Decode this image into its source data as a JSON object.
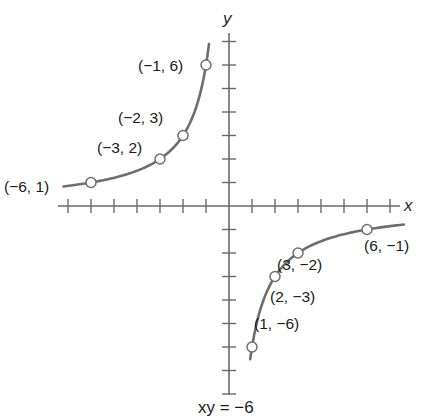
{
  "chart_data": {
    "type": "line",
    "title": "",
    "caption": "xy = −6",
    "xlabel": "x",
    "ylabel": "y",
    "equation": "xy = -6",
    "xlim": [
      -7,
      7
    ],
    "ylim": [
      -8,
      7
    ],
    "x_ticks": [
      -7,
      -6,
      -5,
      -4,
      -3,
      -2,
      -1,
      1,
      2,
      3,
      4,
      5,
      6,
      7
    ],
    "y_ticks": [
      -8,
      -7,
      -6,
      -5,
      -4,
      -3,
      -2,
      -1,
      1,
      2,
      3,
      4,
      5,
      6,
      7
    ],
    "grid": false,
    "series": [
      {
        "name": "xy = -6 (branch x<0)",
        "points": [
          {
            "x": -6,
            "y": 1,
            "label": "(−6, 1)"
          },
          {
            "x": -3,
            "y": 2,
            "label": "(−3, 2)"
          },
          {
            "x": -2,
            "y": 3,
            "label": "(−2, 3)"
          },
          {
            "x": -1,
            "y": 6,
            "label": "(−1, 6)"
          }
        ]
      },
      {
        "name": "xy = -6 (branch x>0)",
        "points": [
          {
            "x": 1,
            "y": -6,
            "label": "(1, −6)"
          },
          {
            "x": 2,
            "y": -3,
            "label": "(2, −3)"
          },
          {
            "x": 3,
            "y": -2,
            "label": "(3, −2)"
          },
          {
            "x": 6,
            "y": -1,
            "label": "(6, −1)"
          }
        ]
      }
    ]
  },
  "layout": {
    "origin": [
      229,
      206
    ],
    "unit_x": 23,
    "unit_y": 23.5,
    "x_axis": [
      58,
      400
    ],
    "y_axis": [
      33,
      395
    ],
    "branch_left_x": [
      -7.2,
      -0.87
    ],
    "branch_right_x": [
      0.92,
      7.6
    ],
    "label_pos": {
      "(−6, 1)": [
        4,
        192
      ],
      "(−3, 2)": [
        97,
        153
      ],
      "(−2, 3)": [
        118,
        123
      ],
      "(−1, 6)": [
        138,
        71
      ],
      "(1, −6)": [
        254,
        329
      ],
      "(2, −3)": [
        270,
        302
      ],
      "(3, −2)": [
        277,
        270
      ],
      "(6, −1)": [
        364,
        251
      ]
    },
    "xlabel_pos": [
      404,
      211
    ],
    "ylabel_pos": [
      223,
      24
    ],
    "caption_pos": [
      198,
      413
    ],
    "colors": {
      "axis": "#6a6a6a",
      "curve": "#6e6e6e",
      "text": "#1a1a1a"
    }
  }
}
